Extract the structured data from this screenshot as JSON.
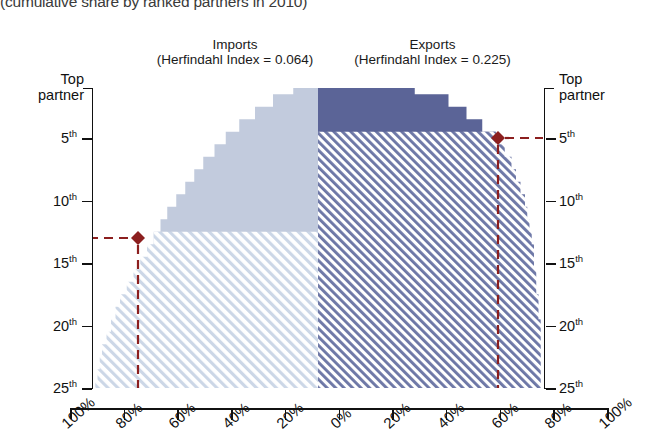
{
  "chart_title": "(cumulative share by ranked partners in 2010)",
  "panels": {
    "imports": {
      "name": "Imports",
      "index_label": "(Herfindahl Index = 0.064)",
      "herfindahl_index": 0.064,
      "solid_color": "#c2cbdd",
      "hatch_color": "#ccd6e6"
    },
    "exports": {
      "name": "Exports",
      "index_label": "(Herfindahl Index = 0.225)",
      "herfindahl_index": 0.225,
      "solid_color": "#5b6497",
      "hatch_color": "#6b75a5"
    }
  },
  "y_axis": {
    "top_label_line1": "Top",
    "top_label_line2": "partner",
    "ticks": [
      {
        "label": "5",
        "sup": "th",
        "rank": 5
      },
      {
        "label": "10",
        "sup": "th",
        "rank": 10
      },
      {
        "label": "15",
        "sup": "th",
        "rank": 15
      },
      {
        "label": "20",
        "sup": "th",
        "rank": 20
      },
      {
        "label": "25",
        "sup": "th",
        "rank": 25
      }
    ]
  },
  "x_axis": {
    "labels": [
      "100%",
      "80%",
      "60%",
      "40%",
      "20%",
      "0%",
      "20%",
      "40%",
      "60%",
      "80%",
      "100%"
    ]
  },
  "markers": {
    "imports": {
      "rank": 13,
      "share_percent": 80,
      "color": "#8c1f1f"
    },
    "exports": {
      "rank": 5,
      "share_percent": 80,
      "color": "#8c1f1f"
    }
  },
  "chart_data": {
    "type": "area",
    "title": "(cumulative share by ranked partners in 2010)",
    "xlabel": "",
    "ylabel": "Partner rank",
    "orientation": "horizontal-mirrored",
    "xlim": [
      -100,
      100
    ],
    "ylim": [
      1,
      25
    ],
    "grid": false,
    "legend_position": "top",
    "y_ticks": [
      "Top partner",
      "5th",
      "10th",
      "15th",
      "20th",
      "25th"
    ],
    "x_ticks": [
      "100%",
      "80%",
      "60%",
      "40%",
      "20%",
      "0%",
      "20%",
      "40%",
      "60%",
      "80%",
      "100%"
    ],
    "series": [
      {
        "name": "Imports",
        "side": "left",
        "herfindahl_index": 0.064,
        "color": "#c2cbdd",
        "ranks": [
          1,
          2,
          3,
          4,
          5,
          6,
          7,
          8,
          9,
          10,
          11,
          12,
          13,
          14,
          15,
          16,
          17,
          18,
          19,
          20,
          21,
          22,
          23,
          24,
          25
        ],
        "cumulative_share_percent": [
          11,
          20,
          28,
          35,
          41,
          46,
          51,
          55,
          59,
          63,
          67,
          70,
          73,
          76,
          79,
          82,
          85,
          88,
          90,
          92,
          94,
          96,
          97,
          98,
          99
        ]
      },
      {
        "name": "Exports",
        "side": "right",
        "herfindahl_index": 0.225,
        "color": "#5b6497",
        "ranks": [
          1,
          2,
          3,
          4,
          5,
          6,
          7,
          8,
          9,
          10,
          11,
          12,
          13,
          14,
          15,
          16,
          17,
          18,
          19,
          20,
          21,
          22,
          23,
          24,
          25
        ],
        "cumulative_share_percent": [
          43,
          58,
          66,
          73,
          79,
          83,
          86,
          88,
          90,
          92,
          93,
          94,
          95,
          96,
          96,
          97,
          97,
          98,
          98,
          99,
          99,
          99,
          99,
          99,
          99
        ]
      }
    ],
    "annotations": [
      {
        "series": "Imports",
        "rank": 13,
        "share_percent": 80,
        "marker": "diamond",
        "color": "#8c1f1f"
      },
      {
        "series": "Exports",
        "rank": 5,
        "share_percent": 80,
        "marker": "diamond",
        "color": "#8c1f1f"
      }
    ]
  }
}
